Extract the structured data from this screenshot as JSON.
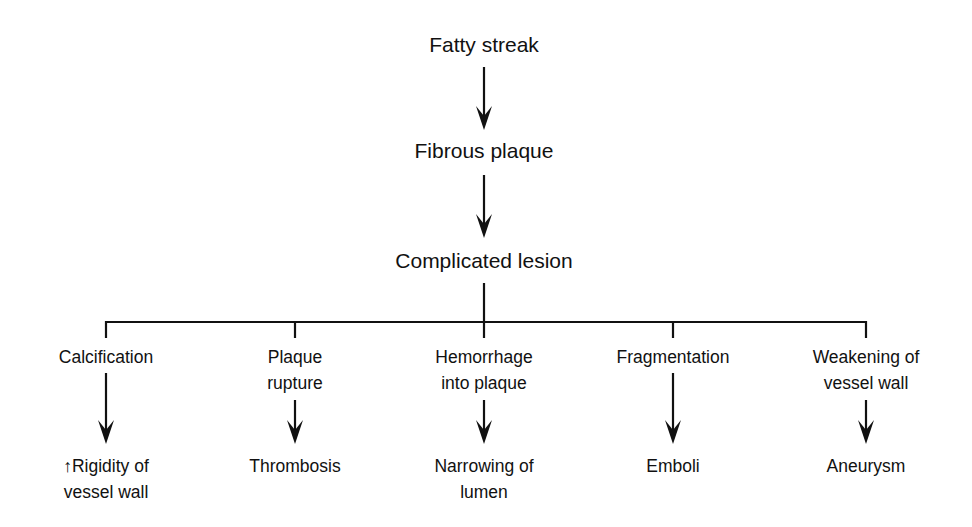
{
  "diagram": {
    "type": "flowchart",
    "stages": [
      {
        "id": "fatty-streak",
        "label": "Fatty streak"
      },
      {
        "id": "fibrous-plaque",
        "label": "Fibrous plaque"
      },
      {
        "id": "complicated-lesion",
        "label": "Complicated lesion"
      }
    ],
    "branches": [
      {
        "id": "calcification",
        "label_lines": [
          "Calcification"
        ],
        "outcome_lines": [
          "↑Rigidity of",
          "vessel wall"
        ]
      },
      {
        "id": "plaque-rupture",
        "label_lines": [
          "Plaque",
          "rupture"
        ],
        "outcome_lines": [
          "Thrombosis"
        ]
      },
      {
        "id": "hemorrhage",
        "label_lines": [
          "Hemorrhage",
          "into plaque"
        ],
        "outcome_lines": [
          "Narrowing of",
          "lumen"
        ]
      },
      {
        "id": "fragmentation",
        "label_lines": [
          "Fragmentation"
        ],
        "outcome_lines": [
          "Emboli"
        ]
      },
      {
        "id": "weakening",
        "label_lines": [
          "Weakening of",
          "vessel wall"
        ],
        "outcome_lines": [
          "Aneurysm"
        ]
      }
    ],
    "edges": [
      [
        "fatty-streak",
        "fibrous-plaque"
      ],
      [
        "fibrous-plaque",
        "complicated-lesion"
      ],
      [
        "complicated-lesion",
        "calcification"
      ],
      [
        "complicated-lesion",
        "plaque-rupture"
      ],
      [
        "complicated-lesion",
        "hemorrhage"
      ],
      [
        "complicated-lesion",
        "fragmentation"
      ],
      [
        "complicated-lesion",
        "weakening"
      ],
      [
        "calcification",
        "rigidity"
      ],
      [
        "plaque-rupture",
        "thrombosis"
      ],
      [
        "hemorrhage",
        "narrowing"
      ],
      [
        "fragmentation",
        "emboli"
      ],
      [
        "weakening",
        "aneurysm"
      ]
    ],
    "colors": {
      "line": "#111111",
      "background": "#ffffff"
    }
  }
}
